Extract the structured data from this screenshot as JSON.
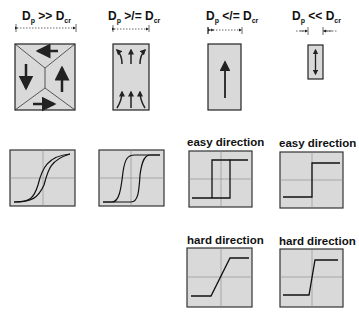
{
  "columns": [
    {
      "id": "large",
      "label_main": "D",
      "label_sub_p": "p",
      "relation": ">>",
      "label_main2": "D",
      "label_sub_cr": "cr"
    },
    {
      "id": "medium",
      "label_main": "D",
      "label_sub_p": "p",
      "relation": ">/=",
      "label_main2": "D",
      "label_sub_cr": "cr"
    },
    {
      "id": "small",
      "label_main": "D",
      "label_sub_p": "p",
      "relation": "</=",
      "label_main2": "D",
      "label_sub_cr": "cr"
    },
    {
      "id": "tiny",
      "label_main": "D",
      "label_sub_p": "p",
      "relation": "<<",
      "label_main2": "D",
      "label_sub_cr": "cr"
    }
  ],
  "direction_labels": {
    "easy_1": "easy direction",
    "easy_2": "easy direction",
    "hard_1": "hard direction",
    "hard_2": "hard direction"
  },
  "colors": {
    "box_fill": "#d9d9d9",
    "stroke": "#222222",
    "grid": "#888888"
  }
}
